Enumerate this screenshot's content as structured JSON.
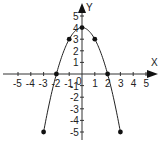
{
  "chart_data": {
    "type": "line",
    "title": "",
    "xlabel": "X",
    "ylabel": "Y",
    "equation_implied": "y = 4 - x^2",
    "x_ticks": [
      -5,
      -4,
      -3,
      -2,
      -1,
      1,
      2,
      3,
      4,
      5
    ],
    "y_ticks": [
      -5,
      -4,
      -3,
      -2,
      -1,
      1,
      2,
      3,
      4,
      5
    ],
    "origin_label": "0",
    "xlim": [
      -5.5,
      6
    ],
    "ylim": [
      -6,
      5.5
    ],
    "grid": false,
    "points": [
      {
        "x": -3,
        "y": -5
      },
      {
        "x": -2,
        "y": 0
      },
      {
        "x": -1,
        "y": 3
      },
      {
        "x": 0,
        "y": 4
      },
      {
        "x": 1,
        "y": 3
      },
      {
        "x": 2,
        "y": 0
      },
      {
        "x": 3,
        "y": -5
      }
    ],
    "colors": {
      "curve": "#222222",
      "axis": "#333333",
      "point": "#111111"
    }
  }
}
